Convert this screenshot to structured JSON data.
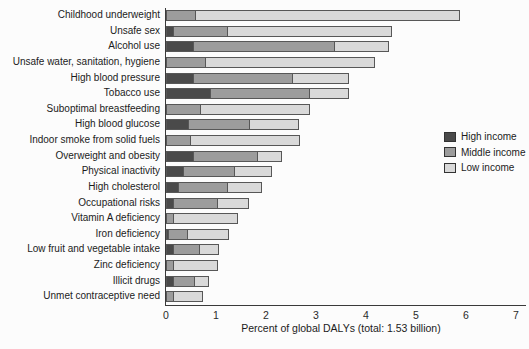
{
  "chart_data": {
    "type": "bar",
    "orientation": "horizontal",
    "stacked": true,
    "title": "",
    "xlabel": "Percent of global DALYs (total: 1.53 billion)",
    "ylabel": "",
    "xlim": [
      0,
      7
    ],
    "xticks": [
      0,
      1,
      2,
      3,
      4,
      5,
      6,
      7
    ],
    "grid": false,
    "legend_position": "right",
    "categories": [
      "Childhood underweight",
      "Unsafe sex",
      "Alcohol use",
      "Unsafe water, sanitation, hygiene",
      "High blood pressure",
      "Tobacco use",
      "Suboptimal breastfeeding",
      "High blood glucose",
      "Indoor smoke from solid fuels",
      "Overweight and obesity",
      "Physical inactivity",
      "High cholesterol",
      "Occupational risks",
      "Vitamin A deficiency",
      "Iron deficiency",
      "Low fruit and vegetable intake",
      "Zinc deficiency",
      "Illicit drugs",
      "Unmet contraceptive need"
    ],
    "series": [
      {
        "name": "High income",
        "color": "#4a4a4a",
        "values": [
          0,
          0.15,
          0.55,
          0,
          0.55,
          0.9,
          0,
          0.45,
          0,
          0.55,
          0.35,
          0.25,
          0.15,
          0,
          0.05,
          0.15,
          0,
          0.15,
          0
        ]
      },
      {
        "name": "Middle income",
        "color": "#9c9c9c",
        "values": [
          0.6,
          1.1,
          2.85,
          0.8,
          2.0,
          2.0,
          0.7,
          1.25,
          0.5,
          1.3,
          1.05,
          1.0,
          0.9,
          0.15,
          0.4,
          0.55,
          0.15,
          0.45,
          0.15
        ]
      },
      {
        "name": "Low income",
        "color": "#d9d9d9",
        "values": [
          5.3,
          3.3,
          1.1,
          3.4,
          1.15,
          0.8,
          2.2,
          1.0,
          2.2,
          0.5,
          0.75,
          0.7,
          0.65,
          1.3,
          0.85,
          0.4,
          0.9,
          0.3,
          0.6
        ]
      }
    ]
  }
}
